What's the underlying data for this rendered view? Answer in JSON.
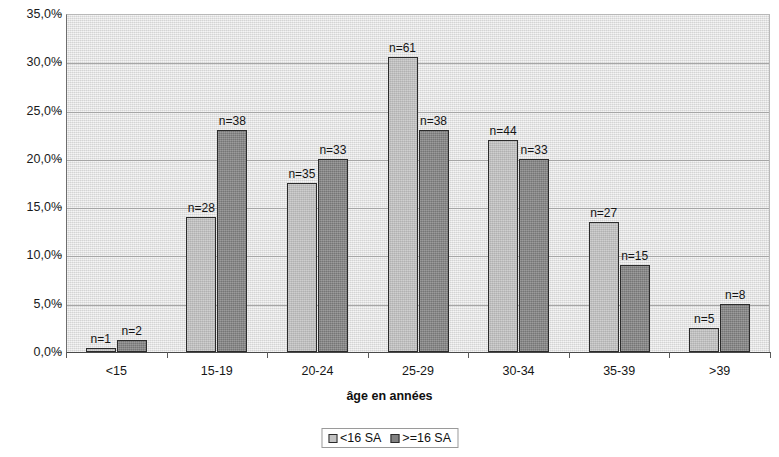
{
  "chart_data": {
    "type": "bar",
    "title": "",
    "subtitle": "",
    "xlabel": "âge en années",
    "ylabel": "",
    "categories": [
      "<15",
      "15-19",
      "20-24",
      "25-29",
      "30-34",
      "35-39",
      ">39"
    ],
    "ylim": [
      0,
      35
    ],
    "ytick_labels": [
      "0,0%",
      "5,0%",
      "10,0%",
      "15,0%",
      "20,0%",
      "25,0%",
      "30,0%",
      "35,0%"
    ],
    "ytick_values": [
      0,
      5,
      10,
      15,
      20,
      25,
      30,
      35
    ],
    "grid": "horizontal",
    "legend_position": "bottom-center",
    "series": [
      {
        "name": "<16 SA",
        "color": "#c2c2c2",
        "values": [
          0.4,
          14.0,
          17.5,
          30.5,
          22.0,
          13.5,
          2.5
        ],
        "point_labels": [
          "n=1",
          "n=28",
          "n=35",
          "n=61",
          "n=44",
          "n=27",
          "n=5"
        ]
      },
      {
        "name": ">=16 SA",
        "color": "#818181",
        "values": [
          1.2,
          23.0,
          20.0,
          23.0,
          20.0,
          9.0,
          5.0
        ],
        "point_labels": [
          "n=2",
          "n=38",
          "n=33",
          "n=38",
          "n=33",
          "n=15",
          "n=8"
        ]
      }
    ]
  },
  "legend": {
    "entries": [
      {
        "label": "<16 SA",
        "swatch": "light-gray-square-icon"
      },
      {
        "label": ">=16 SA",
        "swatch": "dark-gray-square-icon"
      }
    ]
  },
  "colors": {
    "series_light": "#c2c2c2",
    "series_dark": "#818181",
    "plot_background": "#e8e8e8",
    "gridline": "#a6a6a6",
    "axis": "#4a4a4a",
    "text": "#141414"
  }
}
